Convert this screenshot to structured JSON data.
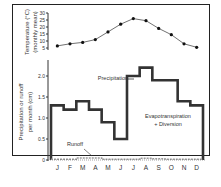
{
  "chart_data": [
    {
      "type": "line",
      "title": "",
      "ylabel": "Temperature (°C) (monthly mean)",
      "categories": [
        "J",
        "F",
        "M",
        "A",
        "M",
        "J",
        "J",
        "A",
        "S",
        "O",
        "N",
        "D"
      ],
      "values": [
        6.5,
        8,
        9,
        11,
        16.5,
        22,
        26,
        24.5,
        19,
        14.5,
        8,
        5.5
      ],
      "yticks": [
        5,
        10,
        15,
        20,
        25,
        30
      ],
      "ylim": [
        5,
        30
      ]
    },
    {
      "type": "line",
      "step": true,
      "xlabel": "",
      "ylabel": "Precipitation or runoff per month (cm)",
      "categories": [
        "J",
        "F",
        "M",
        "A",
        "M",
        "J",
        "J",
        "A",
        "S",
        "O",
        "N",
        "D"
      ],
      "series": [
        {
          "name": "Precipitation",
          "values": [
            1.3,
            1.2,
            1.4,
            1.2,
            0.9,
            0.5,
            2.0,
            2.2,
            1.9,
            1.9,
            1.4,
            1.3
          ]
        },
        {
          "name": "Runoff",
          "values": [
            0.02,
            0.02,
            0.05,
            0.05,
            0.02,
            0.02,
            0.02,
            0.04,
            0.03,
            0.02,
            0.02,
            0.02
          ]
        }
      ],
      "yticks": [
        0,
        0.5,
        1.0,
        1.5,
        2.0
      ],
      "ytick_labels": [
        "0",
        "0.5",
        "1.0",
        "1.5",
        "2.0"
      ],
      "ylim": [
        0,
        2.3
      ],
      "annotations": [
        "Precipitation",
        "Runoff",
        "Evapotranspiration + Diversion"
      ]
    }
  ],
  "labels": {
    "temp_axis_line1": "Temperature (°C)",
    "temp_axis_line2": "(monthly mean)",
    "precip_axis_line1": "Precipitation or runoff",
    "precip_axis_line2": "per month (cm)",
    "precip_label": "Precipitation",
    "runoff_label": "Runoff",
    "et_line1": "Evapotranspiration",
    "et_line2": "+ Diversion"
  }
}
